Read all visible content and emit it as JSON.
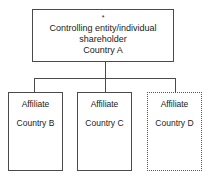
{
  "diagram": {
    "type": "organizational-hierarchy",
    "orientation": "top-down",
    "root": {
      "footnote_marker": "*",
      "line1": "Controlling entity/individual",
      "line2": "shareholder",
      "line3": "Country A",
      "border_style": "solid",
      "border_color": "#4a4a4a"
    },
    "children": [
      {
        "title": "Affiliate",
        "country": "Country B",
        "border_style": "solid",
        "border_color": "#4a4a4a"
      },
      {
        "title": "Affiliate",
        "country": "Country C",
        "border_style": "solid",
        "border_color": "#4a4a4a"
      },
      {
        "title": "Affiliate",
        "country": "Country D",
        "border_style": "dotted",
        "border_color": "#555555"
      }
    ],
    "background_color": "#ffffff",
    "text_color": "#1a1a1a"
  }
}
